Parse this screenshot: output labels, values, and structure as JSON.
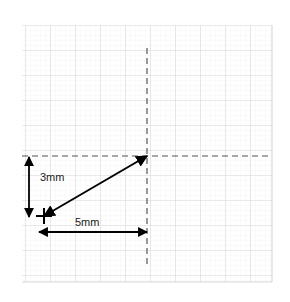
{
  "figure": {
    "background_color": "#ffffff",
    "grid": {
      "major_color": "#d9d9d9",
      "minor_color": "#eeeeee",
      "major_spacing_px": 25,
      "minor_spacing_px": 5,
      "left_px": 22,
      "top_px": 25,
      "right_px": 272,
      "bottom_px": 282,
      "columns": 10,
      "rows": 10
    },
    "guides": {
      "color": "#555555",
      "dash_pattern": "6 4",
      "horizontal": {
        "y_px": 156,
        "x_start_px": 22,
        "x_end_px": 272
      },
      "vertical": {
        "x_px": 147,
        "y_start_px": 48,
        "y_end_px": 265
      }
    },
    "vector": {
      "color": "#000000",
      "double_headed": true,
      "tail_px": {
        "x": 44,
        "y": 216
      },
      "head_px": {
        "x": 147,
        "y": 156
      },
      "origin_marker": "plus-cross"
    },
    "dimensions": [
      {
        "id": "vertical-dimension",
        "label": "3mm",
        "value": 3,
        "unit": "mm",
        "orientation": "vertical",
        "axis_px": 29,
        "start_px": 157,
        "end_px": 217,
        "label_x_px": 40,
        "label_y_px": 181,
        "color": "#000000"
      },
      {
        "id": "horizontal-dimension",
        "label": "5mm",
        "value": 5,
        "unit": "mm",
        "orientation": "horizontal",
        "axis_px": 232,
        "start_px": 39,
        "end_px": 147,
        "label_x_px": 75,
        "label_y_px": 226,
        "color": "#000000"
      }
    ]
  }
}
